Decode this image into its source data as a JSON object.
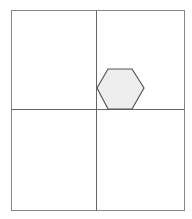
{
  "diagram": {
    "frame": {
      "x": 11,
      "y": 10,
      "width": 173,
      "height": 200,
      "stroke": "#888888"
    },
    "vertical_divider": {
      "x": 96
    },
    "horizontal_divider": {
      "y": 109
    },
    "hexagon": {
      "points": "97,88 108,69 132,69 144,88 132,109 108,109",
      "fill": "#eeeeee",
      "stroke": "#555555"
    }
  }
}
